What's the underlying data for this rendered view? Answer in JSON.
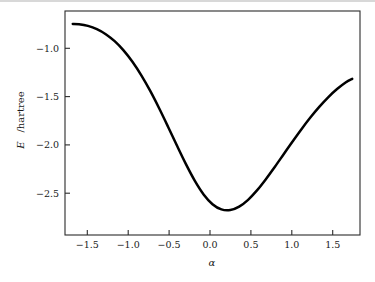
{
  "figure": {
    "background_color": "#ffffff",
    "frame_color": "#2b2b2b",
    "curve_color": "#000000",
    "text_color": "#1a1a1a"
  },
  "axes": {
    "x_tick_labels": [
      "−1.5",
      "−1.0",
      "−0.5",
      "0.0",
      "0.5",
      "1.0",
      "1.5"
    ],
    "y_tick_labels": [
      "−1.0",
      "−1.5",
      "−2.0",
      "−2.5"
    ],
    "xlabel_text": "α",
    "ylabel_main": "E",
    "ylabel_rest": "/hartree"
  },
  "chart_data": {
    "type": "line",
    "title": "",
    "xlabel": "α",
    "ylabel": "E/hartree",
    "xlim": [
      -1.6581,
      1.6581
    ],
    "ylim": [
      -2.9245,
      -0.566
    ],
    "xticks": [
      -1.5,
      -1.0,
      -0.5,
      0.0,
      0.5,
      1.0,
      1.5
    ],
    "yticks": [
      -1.0,
      -1.5,
      -2.0,
      -2.5
    ],
    "grid": false,
    "legend": null,
    "series": [
      {
        "name": "E(α)",
        "color": "#000000",
        "linewidth": 2.5,
        "x": [
          -1.5708,
          -1.5,
          -1.4,
          -1.3,
          -1.2,
          -1.1,
          -1.0,
          -0.9,
          -0.8,
          -0.7,
          -0.6,
          -0.5,
          -0.4,
          -0.3,
          -0.2,
          -0.1,
          0.0,
          0.1,
          0.2,
          0.3,
          0.4,
          0.5,
          0.6,
          0.7,
          0.8,
          0.9,
          1.0,
          1.1,
          1.2,
          1.3,
          1.4,
          1.5,
          1.5708
        ],
        "y": [
          -0.702,
          -0.705,
          -0.723,
          -0.757,
          -0.81,
          -0.884,
          -0.981,
          -1.101,
          -1.244,
          -1.408,
          -1.59,
          -1.784,
          -1.983,
          -2.176,
          -2.352,
          -2.497,
          -2.6,
          -2.655,
          -2.662,
          -2.626,
          -2.554,
          -2.455,
          -2.337,
          -2.208,
          -2.074,
          -1.94,
          -1.81,
          -1.688,
          -1.576,
          -1.475,
          -1.388,
          -1.316,
          -1.28
        ]
      }
    ],
    "annotations": []
  }
}
